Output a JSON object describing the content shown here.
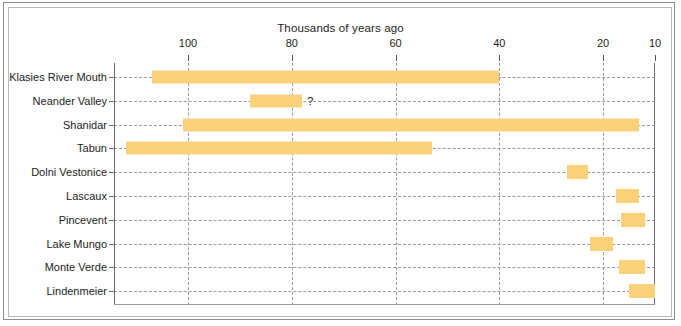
{
  "figure": {
    "frame_color": "#8f8f8f",
    "background": "#ffffff"
  },
  "chart_data": {
    "type": "bar",
    "orientation": "horizontal-range",
    "title": "Thousands of years ago",
    "xlabel": "Thousands of years ago",
    "ylabel": "",
    "xlim": [
      114,
      10
    ],
    "x_reversed": true,
    "xticks": [
      100,
      80,
      60,
      40,
      20,
      10
    ],
    "xtick_labels": [
      "100",
      "80",
      "60",
      "40",
      "20",
      "10"
    ],
    "grid": true,
    "grid_style": "dashed",
    "legend": "none",
    "bar_color": "#fad27c",
    "categories": [
      "Klasies River Mouth",
      "Neander Valley",
      "Shanidar",
      "Tabun",
      "Dolni Vestonice",
      "Lascaux",
      "Pincevent",
      "Lake Mungo",
      "Monte Verde",
      "Lindenmeier"
    ],
    "ranges": [
      {
        "label": "Klasies River Mouth",
        "start": 107,
        "end": 40,
        "annotation": ""
      },
      {
        "label": "Neander Valley",
        "start": 88,
        "end": 78,
        "annotation": "?"
      },
      {
        "label": "Shanidar",
        "start": 101,
        "end": 13,
        "annotation": ""
      },
      {
        "label": "Tabun",
        "start": 112,
        "end": 53,
        "annotation": ""
      },
      {
        "label": "Dolni Vestonice",
        "start": 27,
        "end": 23,
        "annotation": ""
      },
      {
        "label": "Lascaux",
        "start": 17.5,
        "end": 13,
        "annotation": ""
      },
      {
        "label": "Pincevent",
        "start": 16.5,
        "end": 12,
        "annotation": ""
      },
      {
        "label": "Lake Mungo",
        "start": 22.5,
        "end": 18,
        "annotation": ""
      },
      {
        "label": "Monte Verde",
        "start": 17,
        "end": 12,
        "annotation": ""
      },
      {
        "label": "Lindenmeier",
        "start": 15,
        "end": 10,
        "annotation": ""
      }
    ]
  }
}
